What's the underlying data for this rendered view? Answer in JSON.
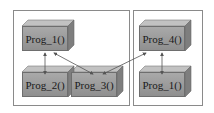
{
  "diagram": {
    "groups": [
      {
        "id": "left-group",
        "x": 13,
        "y": 10,
        "w": 117,
        "h": 96
      },
      {
        "id": "right-group",
        "x": 133,
        "y": 10,
        "w": 70,
        "h": 96
      }
    ],
    "nodes": [
      {
        "id": "n1",
        "label": "Prog_1()",
        "x": 22,
        "y": 20
      },
      {
        "id": "n2",
        "label": "Prog_2()",
        "x": 22,
        "y": 66
      },
      {
        "id": "n3",
        "label": "Prog_3()",
        "x": 71,
        "y": 66
      },
      {
        "id": "n4",
        "label": "Prog_4()",
        "x": 139,
        "y": 20
      },
      {
        "id": "n5",
        "label": "Prog_1()",
        "x": 139,
        "y": 66
      }
    ],
    "edges": [
      {
        "from": "Prog_1()",
        "to": "Prog_2()",
        "bidirectional": true
      },
      {
        "from": "Prog_1()",
        "to": "Prog_3()",
        "bidirectional": true
      },
      {
        "from": "Prog_3()",
        "to": "Prog_4()",
        "bidirectional": true
      },
      {
        "from": "Prog_4()",
        "to": "Prog_1()",
        "bidirectional": true
      }
    ],
    "colors": {
      "box_face": "#9c9c9c",
      "box_top": "#bdbdbd",
      "box_side": "#7d7d7d",
      "border": "#8a8a8a",
      "arrow": "#555555"
    }
  }
}
